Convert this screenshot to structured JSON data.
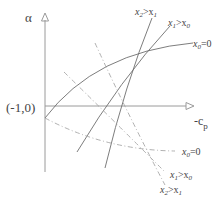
{
  "diagram": {
    "axes": {
      "y_label": "α",
      "x_label": "-c",
      "x_label_sub": "p",
      "origin_label": "(-1,0)"
    },
    "curves": {
      "solid": [
        {
          "id": "solid-x0",
          "label_main": "x",
          "label_sub": "0",
          "label_rest": "=0"
        },
        {
          "id": "solid-x1",
          "label_main": "x",
          "label_sub": "1",
          "label_rest": ">x",
          "label_sub2": "0"
        },
        {
          "id": "solid-x2",
          "label_main": "x",
          "label_sub": "2",
          "label_rest": ">x",
          "label_sub2": "1"
        }
      ],
      "dashdot": [
        {
          "id": "dashdot-x0",
          "label_main": "x",
          "label_sub": "0",
          "label_rest": "=0"
        },
        {
          "id": "dashdot-x1",
          "label_main": "x",
          "label_sub": "1",
          "label_rest": ">x",
          "label_sub2": "0"
        },
        {
          "id": "dashdot-x2",
          "label_main": "x",
          "label_sub": "2",
          "label_rest": ">x",
          "label_sub2": "1"
        }
      ]
    },
    "colors": {
      "axis": "#9a9a9a",
      "solid": "#6e6e6e",
      "dashdot": "#a8a8a8",
      "text": "#444444"
    }
  }
}
